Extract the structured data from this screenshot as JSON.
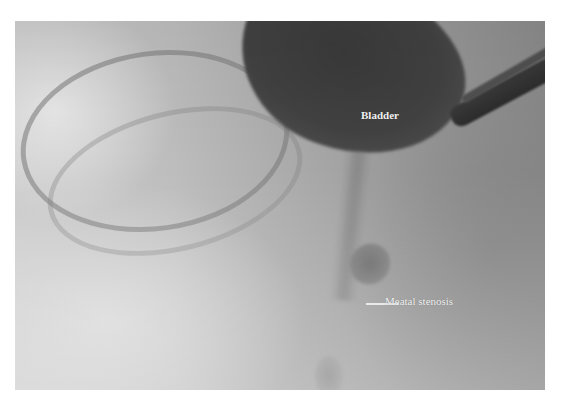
{
  "figure": {
    "type": "fluoroscopic voiding cystourethrogram",
    "colors": {
      "background": "#ffffff",
      "label_text": "#f2f2f2",
      "bladder_contrast": "#3a3a3a"
    }
  },
  "annotations": {
    "bladder": "Bladder",
    "meatal_stenosis": "Meatal stenosis"
  }
}
